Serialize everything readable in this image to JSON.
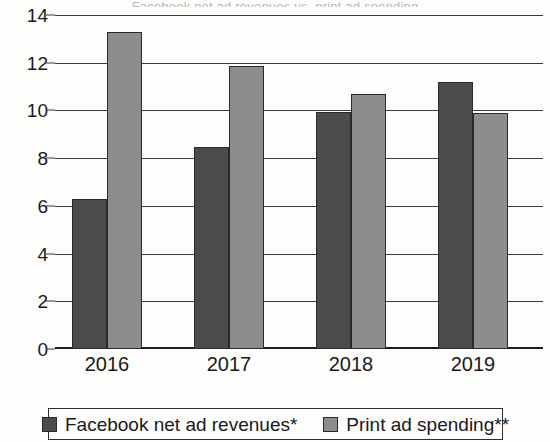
{
  "chart_data": {
    "type": "bar",
    "title": "",
    "title_remnant": "Facebook net ad revenues vs. print ad spending",
    "categories": [
      "2016",
      "2017",
      "2018",
      "2019"
    ],
    "series": [
      {
        "name": "Facebook net ad revenues*",
        "values": [
          6.3,
          8.45,
          9.95,
          11.2
        ],
        "color": "#4c4c4e"
      },
      {
        "name": "Print ad spending**",
        "values": [
          13.3,
          11.85,
          10.7,
          9.9
        ],
        "color": "#8d8d8f"
      }
    ],
    "xlabel": "",
    "ylabel": "",
    "ylim": [
      0,
      14
    ],
    "yticks": [
      "0",
      "2",
      "4",
      "6",
      "8",
      "10",
      "12",
      "14"
    ],
    "ytick_values": [
      0,
      2,
      4,
      6,
      8,
      10,
      12,
      14
    ],
    "grid": true,
    "legend_position": "bottom"
  },
  "legend": {
    "items": [
      {
        "label": "Facebook net ad revenues*",
        "color": "#4c4c4e"
      },
      {
        "label": "Print ad spending**",
        "color": "#8d8d8f"
      }
    ]
  }
}
